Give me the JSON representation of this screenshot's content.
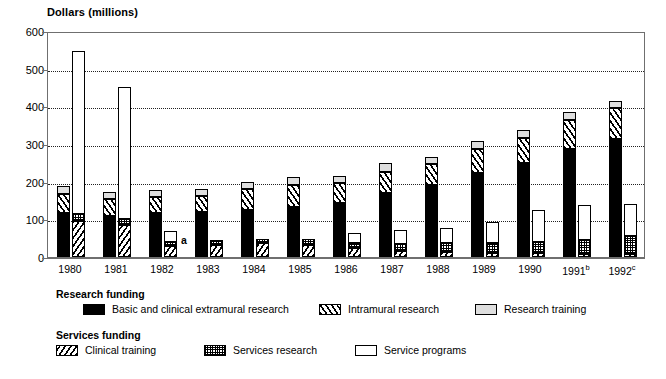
{
  "chart_data": {
    "type": "bar",
    "title": "",
    "ylabel": "Dollars (millions)",
    "xlabel": "",
    "ylim": [
      0,
      600
    ],
    "yticks": [
      0,
      100,
      200,
      300,
      400,
      500,
      600
    ],
    "ytick_labels": [
      "0",
      "100",
      "200",
      "300",
      "400",
      "500",
      "600"
    ],
    "grid": "horizontal-dotted",
    "legend_position": "below-plot",
    "categories": [
      "1980",
      "1981",
      "1982",
      "1983",
      "1984",
      "1985",
      "1986",
      "1987",
      "1988",
      "1989",
      "1990",
      "1991",
      "1992"
    ],
    "category_footnotes": [
      "",
      "",
      "",
      "",
      "",
      "",
      "",
      "",
      "",
      "",
      "",
      "b",
      "c"
    ],
    "annotations": [
      {
        "text": "a",
        "category": "1982",
        "group": "Services funding",
        "note": "footnote marker beside 1982 services bar"
      }
    ],
    "groups": [
      {
        "name": "Research funding",
        "stack_order": [
          "Basic and clinical extramural research",
          "Intramural research",
          "Research training"
        ],
        "series": [
          {
            "name": "Basic and clinical extramural research",
            "fill": "solid-black",
            "values": [
              118,
              108,
              117,
              120,
              126,
              134,
              143,
              170,
              191,
              224,
              250,
              287,
              313
            ]
          },
          {
            "name": "Intramural research",
            "fill": "diagonal-right-hatch",
            "values": [
              50,
              45,
              42,
              43,
              54,
              58,
              53,
              57,
              55,
              63,
              66,
              77,
              82
            ]
          },
          {
            "name": "Research training",
            "fill": "light-gray",
            "values": [
              21,
              19,
              19,
              18,
              20,
              21,
              19,
              22,
              20,
              20,
              22,
              20,
              20
            ]
          }
        ],
        "totals": [
          189,
          172,
          178,
          181,
          200,
          213,
          215,
          249,
          266,
          307,
          338,
          384,
          415
        ]
      },
      {
        "name": "Services funding",
        "stack_order": [
          "Clinical training",
          "Services research",
          "Service programs"
        ],
        "series": [
          {
            "name": "Clinical training",
            "fill": "diagonal-left-hatch",
            "values": [
              95,
              86,
              30,
              33,
              36,
              33,
              23,
              15,
              13,
              11,
              10,
              9,
              9
            ]
          },
          {
            "name": "Services research",
            "fill": "dot-stipple",
            "values": [
              18,
              15,
              9,
              11,
              13,
              14,
              15,
              20,
              24,
              27,
              30,
              37,
              48
            ]
          },
          {
            "name": "Service programs",
            "fill": "white",
            "values": [
              435,
              350,
              31,
              0,
              0,
              0,
              26,
              36,
              41,
              56,
              86,
              92,
              85
            ]
          }
        ],
        "totals": [
          548,
          451,
          70,
          44,
          49,
          47,
          64,
          71,
          78,
          94,
          126,
          138,
          142
        ]
      }
    ]
  },
  "legend": {
    "groups": [
      {
        "title": "Research funding",
        "items": [
          {
            "label": "Basic and clinical extramural research",
            "fill": "solid-black"
          },
          {
            "label": "Intramural research",
            "fill": "diagonal-right-hatch"
          },
          {
            "label": "Research training",
            "fill": "light-gray"
          }
        ]
      },
      {
        "title": "Services funding",
        "items": [
          {
            "label": "Clinical training",
            "fill": "diagonal-left-hatch"
          },
          {
            "label": "Services research",
            "fill": "dot-stipple"
          },
          {
            "label": "Service programs",
            "fill": "white"
          }
        ]
      }
    ]
  }
}
